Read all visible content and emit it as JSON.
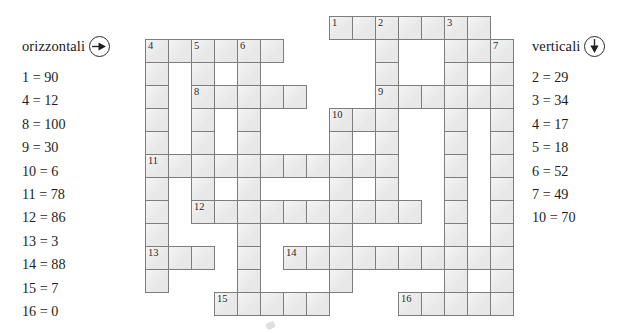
{
  "across": {
    "heading": "orizzontali",
    "direction_icon": "arrow-right-icon",
    "clues": [
      "1 = 90",
      "4 = 12",
      "8 = 100",
      "9 = 30",
      "10 = 6",
      "11 = 78",
      "12 = 86",
      "13 = 3",
      "14 = 88",
      "15 = 7",
      "16 = 0"
    ]
  },
  "down": {
    "heading": "verticali",
    "direction_icon": "arrow-down-icon",
    "clues": [
      "2 = 29",
      "3 = 34",
      "4 = 17",
      "5 = 18",
      "6 = 52",
      "7 = 49",
      "10 = 70"
    ]
  },
  "grid": {
    "cell_size": 24,
    "origin_x": 145,
    "origin_y": 16,
    "cells": [
      {
        "c": 8,
        "r": 0,
        "n": "1"
      },
      {
        "c": 9,
        "r": 0
      },
      {
        "c": 10,
        "r": 0,
        "n": "2"
      },
      {
        "c": 11,
        "r": 0
      },
      {
        "c": 12,
        "r": 0
      },
      {
        "c": 13,
        "r": 0,
        "n": "3"
      },
      {
        "c": 14,
        "r": 0
      },
      {
        "c": 0,
        "r": 1,
        "n": "4"
      },
      {
        "c": 1,
        "r": 1
      },
      {
        "c": 2,
        "r": 1,
        "n": "5"
      },
      {
        "c": 3,
        "r": 1
      },
      {
        "c": 4,
        "r": 1,
        "n": "6"
      },
      {
        "c": 5,
        "r": 1
      },
      {
        "c": 10,
        "r": 1
      },
      {
        "c": 13,
        "r": 1
      },
      {
        "c": 14,
        "r": 1
      },
      {
        "c": 15,
        "r": 1,
        "n": "7"
      },
      {
        "c": 0,
        "r": 2
      },
      {
        "c": 2,
        "r": 2
      },
      {
        "c": 4,
        "r": 2
      },
      {
        "c": 10,
        "r": 2
      },
      {
        "c": 13,
        "r": 2
      },
      {
        "c": 15,
        "r": 2
      },
      {
        "c": 0,
        "r": 3
      },
      {
        "c": 2,
        "r": 3,
        "n": "8"
      },
      {
        "c": 3,
        "r": 3
      },
      {
        "c": 4,
        "r": 3
      },
      {
        "c": 5,
        "r": 3
      },
      {
        "c": 6,
        "r": 3
      },
      {
        "c": 10,
        "r": 3,
        "n": "9"
      },
      {
        "c": 11,
        "r": 3
      },
      {
        "c": 12,
        "r": 3
      },
      {
        "c": 13,
        "r": 3
      },
      {
        "c": 14,
        "r": 3
      },
      {
        "c": 15,
        "r": 3
      },
      {
        "c": 0,
        "r": 4
      },
      {
        "c": 2,
        "r": 4
      },
      {
        "c": 4,
        "r": 4
      },
      {
        "c": 8,
        "r": 4,
        "n": "10"
      },
      {
        "c": 9,
        "r": 4
      },
      {
        "c": 10,
        "r": 4
      },
      {
        "c": 13,
        "r": 4
      },
      {
        "c": 15,
        "r": 4
      },
      {
        "c": 0,
        "r": 5
      },
      {
        "c": 2,
        "r": 5
      },
      {
        "c": 4,
        "r": 5
      },
      {
        "c": 8,
        "r": 5
      },
      {
        "c": 10,
        "r": 5
      },
      {
        "c": 13,
        "r": 5
      },
      {
        "c": 15,
        "r": 5
      },
      {
        "c": 0,
        "r": 6,
        "n": "11"
      },
      {
        "c": 1,
        "r": 6
      },
      {
        "c": 2,
        "r": 6
      },
      {
        "c": 3,
        "r": 6
      },
      {
        "c": 4,
        "r": 6
      },
      {
        "c": 5,
        "r": 6
      },
      {
        "c": 6,
        "r": 6
      },
      {
        "c": 7,
        "r": 6
      },
      {
        "c": 8,
        "r": 6
      },
      {
        "c": 9,
        "r": 6
      },
      {
        "c": 10,
        "r": 6
      },
      {
        "c": 13,
        "r": 6
      },
      {
        "c": 15,
        "r": 6
      },
      {
        "c": 0,
        "r": 7
      },
      {
        "c": 2,
        "r": 7
      },
      {
        "c": 4,
        "r": 7
      },
      {
        "c": 8,
        "r": 7
      },
      {
        "c": 10,
        "r": 7
      },
      {
        "c": 13,
        "r": 7
      },
      {
        "c": 15,
        "r": 7
      },
      {
        "c": 0,
        "r": 8
      },
      {
        "c": 2,
        "r": 8,
        "n": "12"
      },
      {
        "c": 3,
        "r": 8
      },
      {
        "c": 4,
        "r": 8
      },
      {
        "c": 5,
        "r": 8
      },
      {
        "c": 6,
        "r": 8
      },
      {
        "c": 7,
        "r": 8
      },
      {
        "c": 8,
        "r": 8
      },
      {
        "c": 9,
        "r": 8
      },
      {
        "c": 10,
        "r": 8
      },
      {
        "c": 11,
        "r": 8
      },
      {
        "c": 13,
        "r": 8
      },
      {
        "c": 15,
        "r": 8
      },
      {
        "c": 0,
        "r": 9
      },
      {
        "c": 4,
        "r": 9
      },
      {
        "c": 8,
        "r": 9
      },
      {
        "c": 13,
        "r": 9
      },
      {
        "c": 15,
        "r": 9
      },
      {
        "c": 0,
        "r": 10,
        "n": "13"
      },
      {
        "c": 1,
        "r": 10
      },
      {
        "c": 2,
        "r": 10
      },
      {
        "c": 4,
        "r": 10
      },
      {
        "c": 6,
        "r": 10,
        "n": "14"
      },
      {
        "c": 7,
        "r": 10
      },
      {
        "c": 8,
        "r": 10
      },
      {
        "c": 9,
        "r": 10
      },
      {
        "c": 10,
        "r": 10
      },
      {
        "c": 11,
        "r": 10
      },
      {
        "c": 12,
        "r": 10
      },
      {
        "c": 13,
        "r": 10
      },
      {
        "c": 14,
        "r": 10
      },
      {
        "c": 15,
        "r": 10
      },
      {
        "c": 0,
        "r": 11
      },
      {
        "c": 4,
        "r": 11
      },
      {
        "c": 8,
        "r": 11
      },
      {
        "c": 13,
        "r": 11
      },
      {
        "c": 15,
        "r": 11
      },
      {
        "c": 3,
        "r": 12,
        "n": "15"
      },
      {
        "c": 4,
        "r": 12
      },
      {
        "c": 5,
        "r": 12
      },
      {
        "c": 6,
        "r": 12
      },
      {
        "c": 7,
        "r": 12
      },
      {
        "c": 11,
        "r": 12,
        "n": "16"
      },
      {
        "c": 12,
        "r": 12
      },
      {
        "c": 13,
        "r": 12
      },
      {
        "c": 14,
        "r": 12
      },
      {
        "c": 15,
        "r": 12
      }
    ]
  }
}
